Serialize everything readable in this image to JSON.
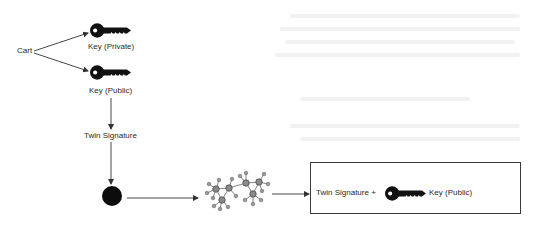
{
  "diagram": {
    "nodes": {
      "cart": {
        "label": "Cart"
      },
      "private_key": {
        "label": "Key (Private)",
        "icon": "key-icon"
      },
      "public_key": {
        "label": "Key (Public)",
        "icon": "key-icon"
      },
      "twin_signature": {
        "label": "Twin Signature"
      },
      "signed_item": {
        "icon": "filled-circle-icon"
      },
      "network": {
        "icon": "network-graph-icon"
      },
      "output": {
        "label_prefix": "Twin Signature +",
        "icon": "key-icon",
        "label_suffix": "Key (Public)"
      }
    },
    "edges": [
      {
        "from": "cart",
        "to": "private_key"
      },
      {
        "from": "cart",
        "to": "public_key"
      },
      {
        "from": "public_key",
        "to": "twin_signature"
      },
      {
        "from": "twin_signature",
        "to": "signed_item"
      },
      {
        "from": "signed_item",
        "to": "network"
      },
      {
        "from": "network",
        "to": "output"
      }
    ],
    "colors": {
      "line": "#333333",
      "key": "#111111",
      "node_fill": "#8a8a8a",
      "node_stroke": "#555555",
      "circle": "#0d0d0d"
    }
  }
}
